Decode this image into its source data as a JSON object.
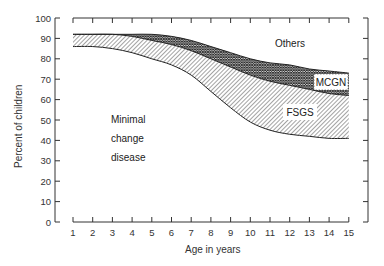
{
  "chart_data": {
    "type": "area",
    "title": "",
    "xlabel": "Age in years",
    "ylabel": "Percent of children",
    "xlim": [
      1,
      15
    ],
    "ylim": [
      0,
      100
    ],
    "x_ticks": [
      1,
      2,
      3,
      4,
      5,
      6,
      7,
      8,
      9,
      10,
      11,
      12,
      13,
      14,
      15
    ],
    "y_ticks": [
      0,
      10,
      20,
      30,
      40,
      50,
      60,
      70,
      80,
      90,
      100
    ],
    "grid": false,
    "stacked": true,
    "x": [
      1,
      2,
      3,
      4,
      5,
      6,
      7,
      8,
      9,
      10,
      11,
      12,
      13,
      14,
      15
    ],
    "boundaries": {
      "fsgs_lower": [
        86,
        86,
        85,
        83,
        80,
        77,
        72,
        64,
        56,
        49,
        45,
        43,
        42,
        41,
        41
      ],
      "mcgn_lower": [
        92,
        92,
        92,
        91,
        89,
        87,
        84,
        80,
        76,
        72,
        69,
        67,
        65,
        63,
        62
      ],
      "others_lower": [
        92,
        92,
        92,
        92,
        92,
        91,
        89,
        86,
        83,
        80,
        78,
        77,
        75,
        74,
        73
      ]
    },
    "series": [
      {
        "name": "Minimal change disease",
        "values": [
          86,
          86,
          85,
          83,
          80,
          77,
          72,
          64,
          56,
          49,
          45,
          43,
          42,
          41,
          41
        ],
        "fill": "none"
      },
      {
        "name": "FSGS",
        "values": [
          6,
          6,
          7,
          8,
          9,
          10,
          12,
          16,
          20,
          23,
          24,
          24,
          23,
          22,
          21
        ],
        "fill": "diagonal-hatch"
      },
      {
        "name": "MCGN",
        "values": [
          0,
          0,
          0,
          1,
          3,
          4,
          5,
          6,
          7,
          8,
          9,
          10,
          10,
          11,
          11
        ],
        "fill": "cross-hatch"
      },
      {
        "name": "Others",
        "values": [
          8,
          8,
          8,
          8,
          8,
          9,
          11,
          14,
          17,
          20,
          22,
          23,
          25,
          26,
          27
        ],
        "fill": "none"
      }
    ],
    "annotations": [
      {
        "text": "Minimal",
        "region": "Minimal change disease"
      },
      {
        "text": "change",
        "region": "Minimal change disease"
      },
      {
        "text": "disease",
        "region": "Minimal change disease"
      },
      {
        "text": "FSGS",
        "region": "FSGS"
      },
      {
        "text": "MCGN",
        "region": "MCGN"
      },
      {
        "text": "Others",
        "region": "Others"
      }
    ]
  },
  "labels": {
    "xlabel": "Age in years",
    "ylabel": "Percent of children",
    "mcd_line1": "Minimal",
    "mcd_line2": "change",
    "mcd_line3": "disease",
    "fsgs": "FSGS",
    "mcgn": "MCGN",
    "others": "Others"
  },
  "colors": {
    "ink": "#222222",
    "background": "#ffffff"
  }
}
